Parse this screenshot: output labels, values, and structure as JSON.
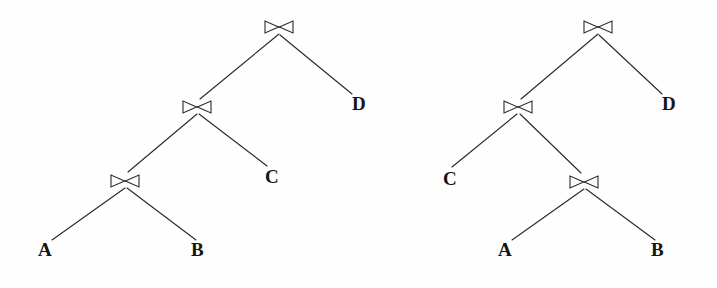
{
  "figure": {
    "kind": "query-plan-join-trees",
    "background_color": "#fefefe",
    "stroke_color": "#2b2b2b",
    "text_color": "#141414",
    "width": 717,
    "height": 288
  },
  "symbols": {
    "join_operator": "bowtie-join-icon",
    "join_glyph": "⋈"
  },
  "trees": [
    {
      "id": "left-tree",
      "name": "left-join-tree",
      "shape": "left-deep",
      "operators": [
        {
          "id": "L-join-root",
          "label": "⋈",
          "x": 279,
          "y": 26
        },
        {
          "id": "L-join-mid",
          "label": "⋈",
          "x": 197,
          "y": 106
        },
        {
          "id": "L-join-bottom",
          "label": "⋈",
          "x": 125,
          "y": 180
        }
      ],
      "leaves": [
        {
          "id": "L-leaf-A",
          "label": "A",
          "x": 45,
          "y": 250
        },
        {
          "id": "L-leaf-B",
          "label": "B",
          "x": 198,
          "y": 250
        },
        {
          "id": "L-leaf-C",
          "label": "C",
          "x": 272,
          "y": 177
        },
        {
          "id": "L-leaf-D",
          "label": "D",
          "x": 360,
          "y": 104
        }
      ],
      "edges": [
        {
          "from": "L-join-root",
          "to": "L-join-mid",
          "x1": 279,
          "y1": 34,
          "x2": 200,
          "y2": 99
        },
        {
          "from": "L-join-root",
          "to": "L-leaf-D",
          "x1": 280,
          "y1": 35,
          "x2": 352,
          "y2": 94
        },
        {
          "from": "L-join-mid",
          "to": "L-join-bottom",
          "x1": 197,
          "y1": 114,
          "x2": 128,
          "y2": 172
        },
        {
          "from": "L-join-mid",
          "to": "L-leaf-C",
          "x1": 199,
          "y1": 114,
          "x2": 267,
          "y2": 166
        },
        {
          "from": "L-join-bottom",
          "to": "L-leaf-A",
          "x1": 125,
          "y1": 188,
          "x2": 52,
          "y2": 240
        },
        {
          "from": "L-join-bottom",
          "to": "L-leaf-B",
          "x1": 127,
          "y1": 188,
          "x2": 196,
          "y2": 240
        }
      ]
    },
    {
      "id": "right-tree",
      "name": "right-join-tree",
      "shape": "bushy",
      "operators": [
        {
          "id": "R-join-root",
          "label": "⋈",
          "x": 598,
          "y": 26
        },
        {
          "id": "R-join-mid",
          "label": "⋈",
          "x": 518,
          "y": 106
        },
        {
          "id": "R-join-bottom",
          "label": "⋈",
          "x": 584,
          "y": 181
        }
      ],
      "leaves": [
        {
          "id": "R-leaf-C",
          "label": "C",
          "x": 450,
          "y": 179
        },
        {
          "id": "R-leaf-A",
          "label": "A",
          "x": 505,
          "y": 250
        },
        {
          "id": "R-leaf-B",
          "label": "B",
          "x": 658,
          "y": 250
        },
        {
          "id": "R-leaf-D",
          "label": "D",
          "x": 670,
          "y": 104
        }
      ],
      "edges": [
        {
          "from": "R-join-root",
          "to": "R-join-mid",
          "x1": 598,
          "y1": 34,
          "x2": 521,
          "y2": 99
        },
        {
          "from": "R-join-root",
          "to": "R-leaf-D",
          "x1": 599,
          "y1": 35,
          "x2": 662,
          "y2": 94
        },
        {
          "from": "R-join-mid",
          "to": "R-leaf-C",
          "x1": 517,
          "y1": 114,
          "x2": 452,
          "y2": 167
        },
        {
          "from": "R-join-mid",
          "to": "R-join-bottom",
          "x1": 520,
          "y1": 114,
          "x2": 581,
          "y2": 173
        },
        {
          "from": "R-join-bottom",
          "to": "R-leaf-A",
          "x1": 584,
          "y1": 189,
          "x2": 512,
          "y2": 240
        },
        {
          "from": "R-join-bottom",
          "to": "R-leaf-B",
          "x1": 586,
          "y1": 189,
          "x2": 655,
          "y2": 240
        }
      ]
    }
  ]
}
